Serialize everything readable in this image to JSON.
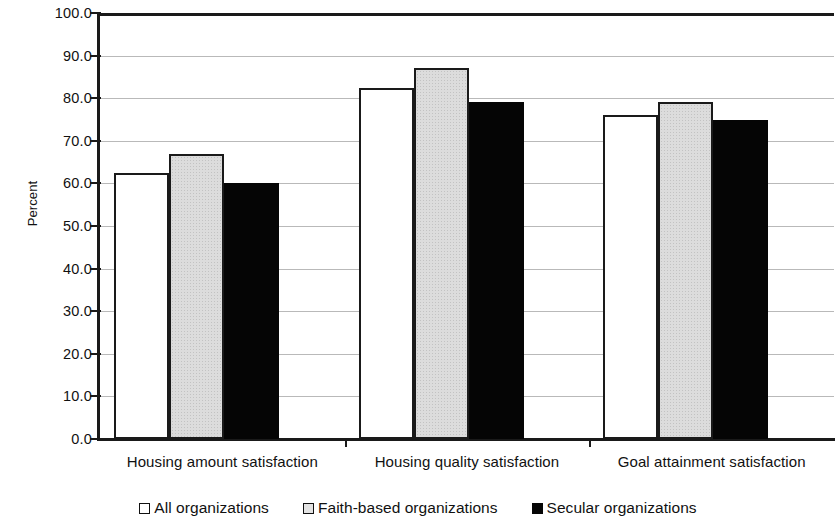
{
  "chart_data": {
    "type": "bar",
    "title": "",
    "subtitle": "",
    "xlabel": "",
    "ylabel": "Percent",
    "ylim": [
      0,
      100
    ],
    "ytick_step": 10,
    "ytick_labels": [
      "100.0",
      "90.0",
      "80.0",
      "70.0",
      "60.0",
      "50.0",
      "40.0",
      "30.0",
      "20.0",
      "10.0",
      "0.0"
    ],
    "ytick_values": [
      100,
      90,
      80,
      70,
      60,
      50,
      40,
      30,
      20,
      10,
      0
    ],
    "grid": true,
    "grid_axis": "y",
    "legend_position": "bottom",
    "categories": [
      "Housing amount satisfaction",
      "Housing quality satisfaction",
      "Goal attainment satisfaction"
    ],
    "series": [
      {
        "name": "All organizations",
        "fill": "#ffffff",
        "values": [
          62.5,
          82.5,
          76.0
        ]
      },
      {
        "name": "Faith-based organizations",
        "fill": "#dcdcdc",
        "values": [
          67.0,
          87.0,
          79.0
        ]
      },
      {
        "name": "Secular organizations",
        "fill": "#050505",
        "values": [
          60.0,
          79.0,
          75.0
        ]
      }
    ]
  },
  "colors": {
    "axis": "#1a1a1a",
    "gridline": "#b9b9b9",
    "bar_outline": "#1a1a1a",
    "text": "#111111",
    "background": "#ffffff"
  }
}
